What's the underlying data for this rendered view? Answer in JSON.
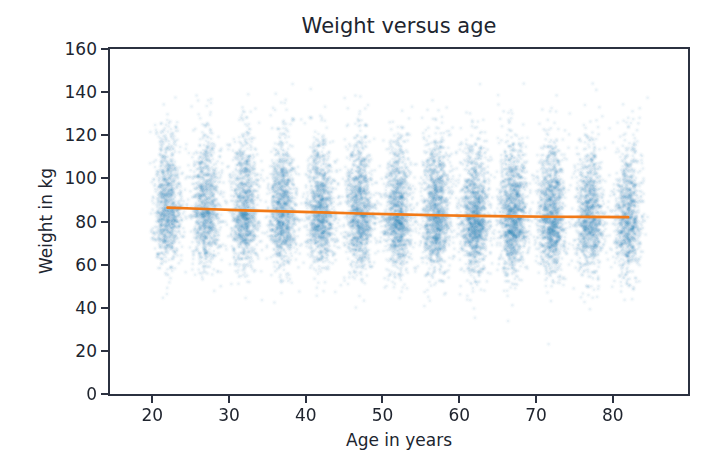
{
  "chart_data": {
    "type": "scatter",
    "title": "Weight versus age",
    "xlabel": "Age in years",
    "ylabel": "Weight in kg",
    "xlim": [
      14.5,
      89.8
    ],
    "ylim": [
      0,
      160
    ],
    "x_ticks": [
      20,
      30,
      40,
      50,
      60,
      70,
      80
    ],
    "y_ticks": [
      0,
      20,
      40,
      60,
      80,
      100,
      120,
      140,
      160
    ],
    "grid": false,
    "legend": "none",
    "axis_color": "#2b3140",
    "text_color": "#20252f",
    "scatter": {
      "color": "#1f77b4",
      "marker": "dot",
      "x_sd_years": 0.9,
      "sd_lower_stretch": 0.85,
      "sd_upper_stretch": 1.18,
      "clusters": [
        {
          "age": 22,
          "n": 1000,
          "mean": 86.4,
          "sd": 15
        },
        {
          "age": 27,
          "n": 1000,
          "mean": 85.8,
          "sd": 15
        },
        {
          "age": 32,
          "n": 1050,
          "mean": 85.2,
          "sd": 15
        },
        {
          "age": 37,
          "n": 1100,
          "mean": 84.7,
          "sd": 15
        },
        {
          "age": 42,
          "n": 1100,
          "mean": 84.2,
          "sd": 15
        },
        {
          "age": 47,
          "n": 1150,
          "mean": 83.7,
          "sd": 15
        },
        {
          "age": 52,
          "n": 1150,
          "mean": 83.3,
          "sd": 15
        },
        {
          "age": 57,
          "n": 1250,
          "mean": 82.9,
          "sd": 15
        },
        {
          "age": 62,
          "n": 1300,
          "mean": 82.6,
          "sd": 15
        },
        {
          "age": 67,
          "n": 1300,
          "mean": 82.4,
          "sd": 15
        },
        {
          "age": 72,
          "n": 1250,
          "mean": 82.2,
          "sd": 15
        },
        {
          "age": 77,
          "n": 1050,
          "mean": 82.1,
          "sd": 15
        },
        {
          "age": 82,
          "n": 950,
          "mean": 82.0,
          "sd": 15
        }
      ]
    },
    "trend_line": {
      "color": "#f27a17",
      "width": 2.7,
      "x": [
        22,
        27,
        32,
        37,
        42,
        47,
        52,
        57,
        62,
        67,
        72,
        77,
        82
      ],
      "y": [
        86.4,
        85.8,
        85.2,
        84.7,
        84.2,
        83.7,
        83.3,
        82.9,
        82.6,
        82.4,
        82.2,
        82.1,
        82.0
      ]
    },
    "render": {
      "dot_radius": 1.3,
      "dot_alpha": 0.065,
      "halo_radius": 2.7,
      "halo_alpha": 0.022,
      "seed": 42
    }
  }
}
